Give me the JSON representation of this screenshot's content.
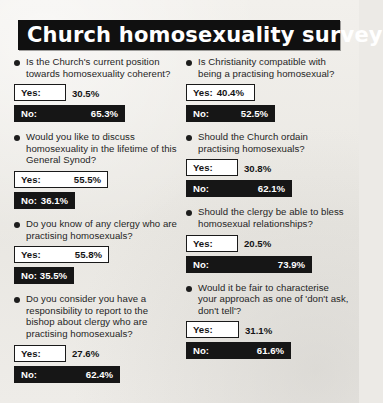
{
  "header": {
    "title": "Church homosexuality survey"
  },
  "chart_data": {
    "type": "bar",
    "title": "Church homosexuality survey",
    "xlabel": "",
    "ylabel": "Percentage of respondents",
    "xlim": [
      0,
      100
    ],
    "grid": false,
    "legend": [
      "Yes",
      "No"
    ],
    "legend_position": "inline",
    "unit": "%",
    "orientation": "horizontal",
    "questions": [
      {
        "column": "left",
        "question": "Is the Church's current position towards homosexuality coherent?",
        "yes_label": "Yes:",
        "no_label": "No:",
        "yes_value": "30.5%",
        "no_value": "65.3%",
        "yes_pct": 30.5,
        "no_pct": 65.3
      },
      {
        "column": "left",
        "question": "Would you like to discuss homosexuality in the lifetime of this General Synod?",
        "yes_label": "Yes:",
        "no_label": "No:",
        "yes_value": "55.5%",
        "no_value": "36.1%",
        "yes_pct": 55.5,
        "no_pct": 36.1
      },
      {
        "column": "left",
        "question": "Do you know of any clergy who are practising homosexuals?",
        "yes_label": "Yes:",
        "no_label": "No:",
        "yes_value": "55.8%",
        "no_value": "35.5%",
        "yes_pct": 55.8,
        "no_pct": 35.5
      },
      {
        "column": "left",
        "question": "Do you consider you have a responsibility to report to the bishop about clergy who are practising homosexuals?",
        "yes_label": "Yes:",
        "no_label": "No:",
        "yes_value": "27.6%",
        "no_value": "62.4%",
        "yes_pct": 27.6,
        "no_pct": 62.4
      },
      {
        "column": "right",
        "question": "Is Christianity compatible with being a practising homosexual?",
        "yes_label": "Yes:",
        "no_label": "No:",
        "yes_value": "40.4%",
        "no_value": "52.5%",
        "yes_pct": 40.4,
        "no_pct": 52.5
      },
      {
        "column": "right",
        "question": "Should the Church ordain practising homosexuals?",
        "yes_label": "Yes:",
        "no_label": "No:",
        "yes_value": "30.8%",
        "no_value": "62.1%",
        "yes_pct": 30.8,
        "no_pct": 62.1
      },
      {
        "column": "right",
        "question": "Should the clergy be able to bless homosexual relationships?",
        "yes_label": "Yes:",
        "no_label": "No:",
        "yes_value": "20.5%",
        "no_value": "73.9%",
        "yes_pct": 20.5,
        "no_pct": 73.9
      },
      {
        "column": "right",
        "question": "Would it be fair to characterise your approach as one of 'don't ask, don't tell'?",
        "yes_label": "Yes:",
        "no_label": "No:",
        "yes_value": "31.1%",
        "no_value": "61.6%",
        "yes_pct": 31.1,
        "no_pct": 61.6
      }
    ]
  },
  "colors": {
    "no_bar": "#161616",
    "yes_bar": "#ffffff",
    "banner": "#101010",
    "paper": "#eceae6"
  }
}
